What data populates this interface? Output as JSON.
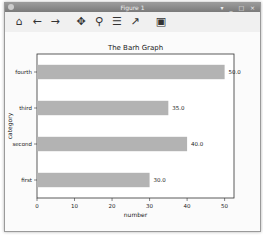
{
  "window": {
    "title": "Figure 1",
    "controls": "▾ _ □ ×"
  },
  "toolbar": {
    "buttons": [
      {
        "name": "home-icon",
        "glyph": "⌂"
      },
      {
        "name": "back-icon",
        "glyph": "←"
      },
      {
        "name": "forward-icon",
        "glyph": "→"
      },
      {
        "name": "pan-icon",
        "glyph": "✥"
      },
      {
        "name": "zoom-icon",
        "glyph": "⚲"
      },
      {
        "name": "configure-subplots-icon",
        "glyph": "☰"
      },
      {
        "name": "edit-axis-icon",
        "glyph": "↗"
      },
      {
        "name": "save-icon",
        "glyph": "▣"
      }
    ]
  },
  "chart_data": {
    "type": "bar",
    "orientation": "horizontal",
    "title": "The Barh Graph",
    "xlabel": "number",
    "ylabel": "category",
    "categories": [
      "first",
      "second",
      "third",
      "fourth"
    ],
    "values": [
      30.0,
      40.0,
      35.0,
      50.0
    ],
    "data_labels": [
      "30.0",
      "40.0",
      "35.0",
      "50.0"
    ],
    "xticks": [
      0,
      10,
      20,
      30,
      40,
      50
    ],
    "xlim": [
      0,
      52.5
    ],
    "bar_color": "#b3b3b3",
    "grid": false,
    "legend": null
  }
}
